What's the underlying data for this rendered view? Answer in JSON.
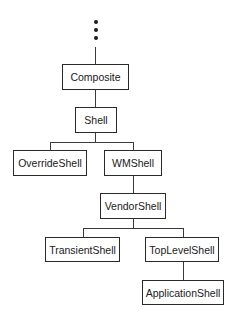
{
  "diagram": {
    "type": "class-hierarchy-tree",
    "ellipsis": "continuation-above",
    "nodes": {
      "composite": "Composite",
      "shell": "Shell",
      "override_shell": "OverrideShell",
      "wm_shell": "WMShell",
      "vendor_shell": "VendorShell",
      "transient_shell": "TransientShell",
      "top_level_shell": "TopLevelShell",
      "application_shell": "ApplicationShell"
    },
    "edges": [
      [
        "composite",
        "shell"
      ],
      [
        "shell",
        "override_shell"
      ],
      [
        "shell",
        "wm_shell"
      ],
      [
        "wm_shell",
        "vendor_shell"
      ],
      [
        "vendor_shell",
        "transient_shell"
      ],
      [
        "vendor_shell",
        "top_level_shell"
      ],
      [
        "top_level_shell",
        "application_shell"
      ]
    ]
  }
}
